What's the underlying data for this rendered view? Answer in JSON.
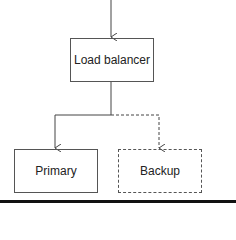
{
  "diagram": {
    "nodes": [
      {
        "id": "load-balancer",
        "label": "Load balancer",
        "style": "solid"
      },
      {
        "id": "primary",
        "label": "Primary",
        "style": "solid"
      },
      {
        "id": "backup",
        "label": "Backup",
        "style": "dashed"
      }
    ],
    "edges": [
      {
        "from": "input",
        "to": "load-balancer",
        "style": "solid"
      },
      {
        "from": "load-balancer",
        "to": "primary",
        "style": "solid"
      },
      {
        "from": "load-balancer",
        "to": "backup",
        "style": "dashed"
      }
    ],
    "colors": {
      "stroke": "#555555",
      "text": "#222222",
      "background": "#ffffff"
    }
  }
}
